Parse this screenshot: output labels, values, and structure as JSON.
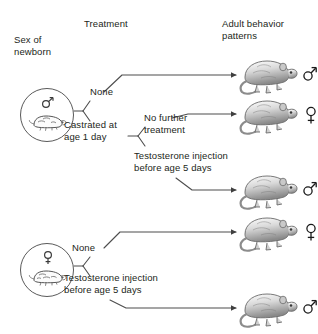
{
  "figure": {
    "background_color": "#ffffff",
    "line_color": "#4d4d4d",
    "text_color": "#231f20"
  },
  "headers": {
    "sex_of_newborn": "Sex of\nnewborn",
    "treatment": "Treatment",
    "adult_behavior": "Adult behavior\npatterns"
  },
  "sources": [
    {
      "id": "newborn-male",
      "sex_symbol": "male",
      "animal": "rat",
      "label": "male newborn rat"
    },
    {
      "id": "newborn-female",
      "sex_symbol": "female",
      "animal": "rat",
      "label": "female newborn rat"
    }
  ],
  "treatments": {
    "male_none": "None",
    "male_castrated": "Castrated at\nage 1 day",
    "male_no_further": "No further\ntreatment",
    "male_testosterone": "Testosterone injection\nbefore age 5 days",
    "female_none": "None",
    "female_testosterone": "Testosterone injection\nbefore age 5 days"
  },
  "outcomes": [
    {
      "id": "outcome-1",
      "sex_symbol": "male",
      "from": "male_none"
    },
    {
      "id": "outcome-2",
      "sex_symbol": "female",
      "from": "male_no_further"
    },
    {
      "id": "outcome-3",
      "sex_symbol": "male",
      "from": "male_testosterone"
    },
    {
      "id": "outcome-4",
      "sex_symbol": "female",
      "from": "female_none"
    },
    {
      "id": "outcome-5",
      "sex_symbol": "male",
      "from": "female_testosterone"
    }
  ]
}
